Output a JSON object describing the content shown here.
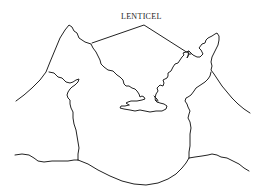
{
  "diagram": {
    "label": "LENTICEL",
    "stroke_color": "#222222",
    "background": "#ffffff"
  }
}
